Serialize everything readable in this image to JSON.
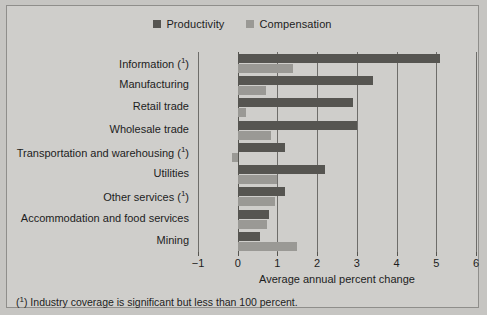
{
  "chart_data": {
    "type": "bar",
    "orientation": "horizontal",
    "title": "",
    "xlabel": "Average annual percent change",
    "ylabel": "",
    "xlim": [
      -1,
      6
    ],
    "xticks": [
      -1,
      0,
      1,
      2,
      3,
      4,
      5,
      6
    ],
    "xticklabels": [
      "−1",
      "0",
      "1",
      "2",
      "3",
      "4",
      "5",
      "6"
    ],
    "grid": true,
    "legend_position": "top-center",
    "categories": [
      "Information (1)",
      "Manufacturing",
      "Retail trade",
      "Wholesale trade",
      "Transportation and warehousing (1)",
      "Utilities",
      "Other services (1)",
      "Accommodation and food services",
      "Mining"
    ],
    "category_labels": [
      {
        "text": "Information",
        "footnote": "1"
      },
      {
        "text": "Manufacturing",
        "footnote": ""
      },
      {
        "text": "Retail trade",
        "footnote": ""
      },
      {
        "text": "Wholesale trade",
        "footnote": ""
      },
      {
        "text": "Transportation and warehousing",
        "footnote": "1"
      },
      {
        "text": "Utilities",
        "footnote": ""
      },
      {
        "text": "Other services",
        "footnote": "1"
      },
      {
        "text": "Accommodation and food services",
        "footnote": ""
      },
      {
        "text": "Mining",
        "footnote": ""
      }
    ],
    "series": [
      {
        "name": "Productivity",
        "color": "#565551",
        "values": [
          5.1,
          3.4,
          2.9,
          3.0,
          1.2,
          2.2,
          1.2,
          0.8,
          0.55
        ]
      },
      {
        "name": "Compensation",
        "color": "#9a9995",
        "values": [
          1.4,
          0.7,
          0.2,
          0.85,
          -0.15,
          1.0,
          0.95,
          0.75,
          1.5
        ]
      }
    ],
    "footnote": "(1) Industry coverage is significant but less than 100 percent."
  },
  "legend": {
    "items": [
      {
        "label": "Productivity",
        "color": "#565551"
      },
      {
        "label": "Compensation",
        "color": "#9a9995"
      }
    ]
  },
  "axis": {
    "title": "Average annual percent change"
  },
  "footnote": {
    "marker": "1",
    "text": " Industry coverage is significant but less than 100 percent."
  },
  "colors": {
    "figure_background": "#c6c5c2",
    "panel_background": "#cfcecb",
    "panel_border": "#8f8e8b",
    "gridline": "#6e6d6a",
    "text": "#1d1d1d",
    "productivity": "#565551",
    "compensation": "#9a9995"
  }
}
